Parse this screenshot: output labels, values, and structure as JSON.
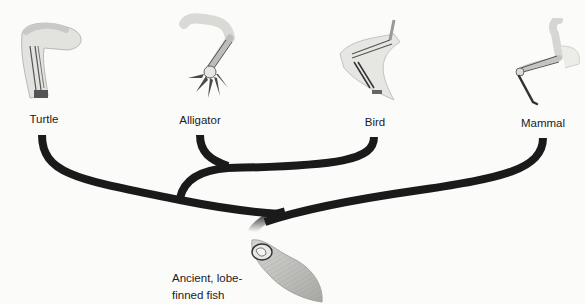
{
  "diagram": {
    "type": "phylogenetic-tree",
    "branch_color": "#1a1a1a",
    "taxa": [
      {
        "id": "turtle",
        "label": "Turtle",
        "limb_icon": "turtle-forelimb-icon"
      },
      {
        "id": "alligator",
        "label": "Alligator",
        "limb_icon": "alligator-forelimb-icon"
      },
      {
        "id": "bird",
        "label": "Bird",
        "limb_icon": "bird-wing-icon"
      },
      {
        "id": "mammal",
        "label": "Mammal",
        "limb_icon": "mammal-forelimb-icon"
      }
    ],
    "ancestor": {
      "label_line1": "Ancient, lobe-",
      "label_line2": "finned fish",
      "fin_icon": "lobe-fin-icon"
    },
    "clades": [
      {
        "members": [
          "alligator",
          "bird"
        ]
      },
      {
        "members": [
          "turtle",
          "alligator",
          "bird",
          "mammal"
        ]
      }
    ]
  }
}
